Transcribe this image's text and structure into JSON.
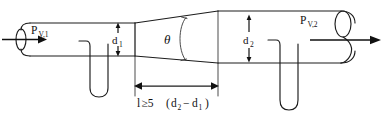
{
  "figure": {
    "kind": "engineering-schematic",
    "background_color": "#ffffff",
    "line_color": "#1c1c1c"
  },
  "labels": {
    "inlet_pressure": {
      "base": "P",
      "subscript": "V,1"
    },
    "outlet_pressure": {
      "base": "P",
      "subscript": "V,2"
    },
    "small_diameter": {
      "base": "d",
      "subscript": "1"
    },
    "large_diameter": {
      "base": "d",
      "subscript": "2"
    },
    "cone_angle": "θ",
    "length_condition": {
      "symbol": "l",
      "relation": "≥5",
      "open_paren": "(",
      "term1_base": "d",
      "term1_sub": "2",
      "minus": "−",
      "term2_base": "d",
      "term2_sub": "1",
      "close_paren": ")",
      "full_text": "l≥5 (d2 −d1 )"
    }
  },
  "annotations": {
    "flow_direction_inlet": "right",
    "flow_direction_outlet": "right",
    "dimension_style": "double-headed-arrow"
  }
}
